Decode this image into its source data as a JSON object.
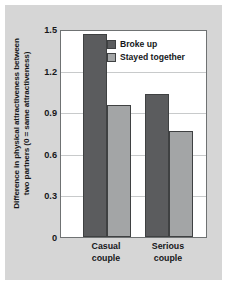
{
  "chart_data": {
    "type": "bar",
    "title": "",
    "subtitle": "",
    "xlabel": "",
    "ylabel": "Difference in physical attractiveness between two partners (0 = same attractiveness)",
    "ylabel_lines": [
      "Difference in physical attractiveness between",
      "two partners (0 = same attractiveness)"
    ],
    "categories": [
      "Casual couple",
      "Serious couple"
    ],
    "category_lines": [
      [
        "Casual",
        "couple"
      ],
      [
        "Serious",
        "couple"
      ]
    ],
    "series": [
      {
        "name": "Broke up",
        "values": [
          1.48,
          1.04
        ],
        "color": "#5b5c5e"
      },
      {
        "name": "Stayed together",
        "values": [
          0.96,
          0.77
        ],
        "color": "#a3a5a6"
      }
    ],
    "ylim": [
      0,
      1.5
    ],
    "yticks": [
      0,
      0.3,
      0.6,
      0.9,
      1.2,
      1.5
    ],
    "ytick_labels": [
      "0",
      "0.3",
      "0.6",
      "0.9",
      "1.2",
      "1.5"
    ],
    "grid": true,
    "legend_position": "top-right"
  },
  "legend": {
    "entries": [
      {
        "label": "Broke up"
      },
      {
        "label": "Stayed together"
      }
    ]
  },
  "colors": {
    "figure_background": "#d6d6d6",
    "plot_background": "#ffffff",
    "axis": "#6f7273",
    "gridline": "#c8cacb",
    "text": "#16181a",
    "series_broke_up": "#5b5c5e",
    "series_stayed_together": "#a3a5a6"
  }
}
